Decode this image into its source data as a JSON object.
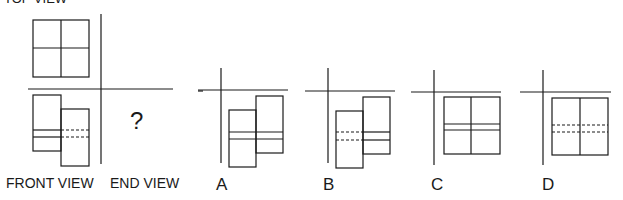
{
  "labels": {
    "top_view": "TOP VIEW",
    "front_view": "FRONT VIEW",
    "end_view": "END VIEW",
    "question_mark": "?"
  },
  "options": [
    {
      "letter": "A",
      "description": "offset L-shape, solid horizontal band lines"
    },
    {
      "letter": "B",
      "description": "offset L-shape, dashed band lines on left part"
    },
    {
      "letter": "C",
      "description": "square with cross, solid horizontal band lines"
    },
    {
      "letter": "D",
      "description": "square split vertically, dashed horizontal band lines"
    }
  ],
  "colors": {
    "line": "#1a1a1a",
    "background": "#ffffff"
  }
}
